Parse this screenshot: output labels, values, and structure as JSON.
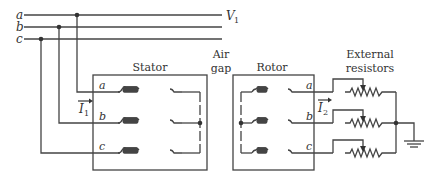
{
  "diagram": {
    "type": "wound-rotor induction motor with external rotor resistors",
    "supply": {
      "phases": [
        "a",
        "b",
        "c"
      ],
      "voltage_label": "V",
      "voltage_subscript": "1"
    },
    "stator": {
      "title": "Stator",
      "phase_labels": [
        "a",
        "b",
        "c"
      ],
      "current_label": "I",
      "current_subscript": "1",
      "connection": "wye"
    },
    "air_gap": {
      "line1": "Air",
      "line2": "gap"
    },
    "rotor": {
      "title": "Rotor",
      "phase_labels": [
        "a",
        "b",
        "c"
      ],
      "current_label": "I",
      "current_subscript": "2",
      "connection": "wye"
    },
    "external_resistors": {
      "line1": "External",
      "line2": "resistors",
      "count": 3,
      "type": "variable (rheostat)",
      "grounded": true
    }
  }
}
